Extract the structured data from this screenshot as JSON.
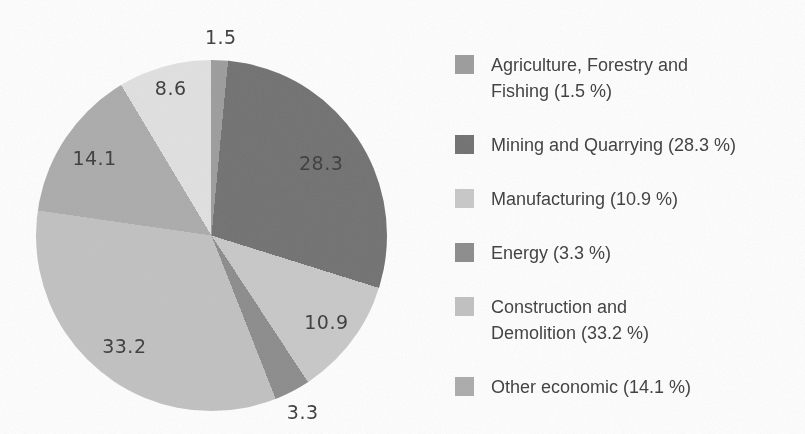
{
  "page": {
    "background_color": "#ffffff",
    "text_color": "#3c3c3c"
  },
  "chart_data": {
    "type": "pie",
    "title": "",
    "unit": "%",
    "values_total": 99.9,
    "start_angle_deg": 0,
    "direction": "clockwise",
    "legend_position": "right",
    "slices": [
      {
        "legend_label": "Agriculture, Forestry and\nFishing (1.5 %)",
        "value": 1.5,
        "pie_label": "1.5",
        "color": "#9c9c9c",
        "label_radius": 1.13
      },
      {
        "legend_label": "Mining and Quarrying (28.3 %)",
        "value": 28.3,
        "pie_label": "28.3",
        "color": "#707070",
        "label_radius": 0.75
      },
      {
        "legend_label": "Manufacturing (10.9 %)",
        "value": 10.9,
        "pie_label": "10.9",
        "color": "#c8c8c8",
        "label_radius": 0.82
      },
      {
        "legend_label": "Energy (3.3 %)",
        "value": 3.3,
        "pie_label": "3.3",
        "color": "#8b8b8b",
        "label_radius": 1.13
      },
      {
        "legend_label": "Construction and\nDemolition (33.2 %)",
        "value": 33.2,
        "pie_label": "33.2",
        "color": "#c1c1c1",
        "label_radius": 0.8
      },
      {
        "legend_label": "Other economic (14.1 %)",
        "value": 14.1,
        "pie_label": "14.1",
        "color": "#ababab",
        "label_radius": 0.8
      },
      {
        "legend_label": null,
        "value": 8.6,
        "pie_label": "8.6",
        "color": "#e1e1e1",
        "label_radius": 0.87
      }
    ]
  }
}
